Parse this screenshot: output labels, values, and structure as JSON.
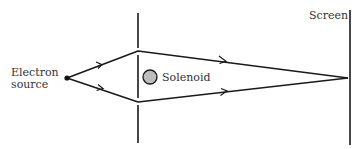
{
  "diagram": {
    "labels": {
      "source_line1": "Electron",
      "source_line2": "source",
      "solenoid": "Solenoid",
      "screen": "Screen"
    },
    "colors": {
      "line": "#1a1a1a",
      "solenoid_fill": "#bdbdbd",
      "text": "#333333"
    },
    "geometry": {
      "source": [
        67,
        78
      ],
      "upper_slit": [
        138,
        51
      ],
      "lower_slit": [
        138,
        102
      ],
      "focus": [
        348,
        78
      ],
      "barrier_x": 138,
      "screen_x": 350,
      "solenoid_center": [
        150,
        77
      ],
      "solenoid_radius": 7
    }
  }
}
